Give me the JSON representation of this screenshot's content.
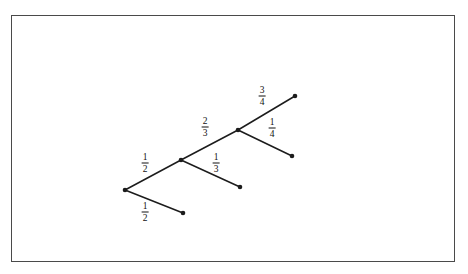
{
  "figure": {
    "type": "probability-tree-diagram",
    "frame": {
      "x": 11,
      "y": 15,
      "width": 444,
      "height": 247,
      "border_color": "#4a4a4a"
    },
    "background_color": "#ffffff",
    "line_color": "#1c1c1c"
  },
  "nodes": [
    {
      "id": "root",
      "label": "root-node",
      "x": 125,
      "y": 190
    },
    {
      "id": "n2",
      "label": "branch-node-2",
      "x": 181,
      "y": 160
    },
    {
      "id": "n3",
      "label": "branch-node-3",
      "x": 238,
      "y": 130
    },
    {
      "id": "leaf1",
      "label": "leaf-bottom-left",
      "x": 183,
      "y": 213
    },
    {
      "id": "leaf2",
      "label": "leaf-middle",
      "x": 240,
      "y": 187
    },
    {
      "id": "leaf3",
      "label": "leaf-top-right",
      "x": 295,
      "y": 96
    },
    {
      "id": "leaf4",
      "label": "leaf-lower-right",
      "x": 292,
      "y": 156
    }
  ],
  "edges": [
    {
      "id": "e1",
      "from": "root",
      "to": "n2",
      "name": "edge-root-to-node2"
    },
    {
      "id": "e2",
      "from": "root",
      "to": "leaf1",
      "name": "edge-root-to-leaf1"
    },
    {
      "id": "e3",
      "from": "n2",
      "to": "n3",
      "name": "edge-node2-to-node3"
    },
    {
      "id": "e4",
      "from": "n2",
      "to": "leaf2",
      "name": "edge-node2-to-leaf2"
    },
    {
      "id": "e5",
      "from": "n3",
      "to": "leaf3",
      "name": "edge-node3-to-leaf3"
    },
    {
      "id": "e6",
      "from": "n3",
      "to": "leaf4",
      "name": "edge-node3-to-leaf4"
    }
  ],
  "labels": [
    {
      "id": "l1",
      "edge": "e1",
      "numerator": "1",
      "denominator": "2",
      "x": 145,
      "y": 163
    },
    {
      "id": "l2",
      "edge": "e2",
      "numerator": "1",
      "denominator": "2",
      "x": 145,
      "y": 212
    },
    {
      "id": "l3",
      "edge": "e3",
      "numerator": "2",
      "denominator": "3",
      "x": 205,
      "y": 127
    },
    {
      "id": "l4",
      "edge": "e4",
      "numerator": "1",
      "denominator": "3",
      "x": 216,
      "y": 163
    },
    {
      "id": "l5",
      "edge": "e5",
      "numerator": "3",
      "denominator": "4",
      "x": 262,
      "y": 96
    },
    {
      "id": "l6",
      "edge": "e6",
      "numerator": "1",
      "denominator": "4",
      "x": 272,
      "y": 128
    }
  ],
  "chart_data": {
    "type": "tree",
    "title": "",
    "branch_probabilities": [
      {
        "level": 1,
        "branch": "upper",
        "value": "1/2",
        "numerator": 1,
        "denominator": 2
      },
      {
        "level": 1,
        "branch": "lower",
        "value": "1/2",
        "numerator": 1,
        "denominator": 2
      },
      {
        "level": 2,
        "branch": "upper",
        "value": "2/3",
        "numerator": 2,
        "denominator": 3
      },
      {
        "level": 2,
        "branch": "lower",
        "value": "1/3",
        "numerator": 1,
        "denominator": 3
      },
      {
        "level": 3,
        "branch": "upper",
        "value": "3/4",
        "numerator": 3,
        "denominator": 4
      },
      {
        "level": 3,
        "branch": "lower",
        "value": "1/4",
        "numerator": 1,
        "denominator": 4
      }
    ],
    "node_count": 7,
    "edge_count": 6,
    "depth": 3
  }
}
